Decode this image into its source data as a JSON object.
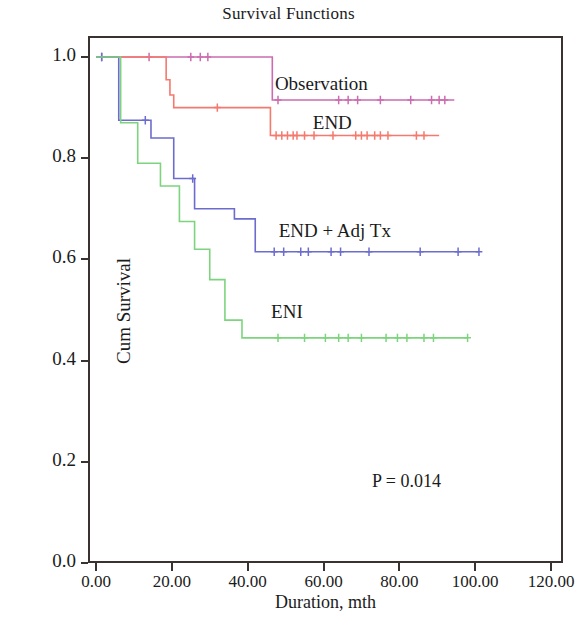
{
  "chart_data": {
    "type": "line",
    "title": "Survival Functions",
    "xlabel": "Duration, mth",
    "ylabel": "Cum Survival",
    "xlim": [
      0,
      120
    ],
    "ylim": [
      0.0,
      1.0
    ],
    "xticks": [
      "0.00",
      "20.00",
      "40.00",
      "60.00",
      "80.00",
      "100.00",
      "120.00"
    ],
    "xtick_values": [
      0,
      20,
      40,
      60,
      80,
      100,
      120
    ],
    "yticks": [
      "0.0",
      "0.2",
      "0.4",
      "0.6",
      "0.8",
      "1.0"
    ],
    "ytick_values": [
      0.0,
      0.2,
      0.4,
      0.6,
      0.8,
      1.0
    ],
    "grid": false,
    "legend_position": "inline-right-of-curves",
    "annotations": [
      {
        "text": "P = 0.014",
        "x": 84,
        "y": 0.17
      }
    ],
    "series": [
      {
        "name": "Observation",
        "color": "#cc6cb0",
        "label_x": 63,
        "label_y": 0.945,
        "steps": [
          [
            0,
            1.0
          ],
          [
            46.5,
            1.0
          ],
          [
            46.5,
            0.915
          ],
          [
            94.5,
            0.915
          ]
        ],
        "censored": [
          1.5,
          14.0,
          25.0,
          27.5,
          29.5,
          48.0,
          64.0,
          66.5,
          69.0,
          75.0,
          83.0,
          88.5,
          90.5,
          92.0
        ]
      },
      {
        "name": "END",
        "color": "#f4796e",
        "label_x": 73,
        "label_y": 0.868,
        "steps": [
          [
            0,
            1.0
          ],
          [
            18.5,
            1.0
          ],
          [
            18.5,
            0.955
          ],
          [
            19.5,
            0.955
          ],
          [
            19.5,
            0.925
          ],
          [
            20.5,
            0.925
          ],
          [
            20.5,
            0.9
          ],
          [
            46.0,
            0.9
          ],
          [
            46.0,
            0.845
          ],
          [
            90.5,
            0.845
          ]
        ],
        "censored": [
          47.5,
          49.0,
          50.5,
          52.0,
          53.0,
          55.0,
          57.5,
          62.5,
          68.5,
          70.0,
          71.5,
          73.5,
          75.0,
          77.0,
          84.5,
          86.5
        ],
        "censored_early": [
          32.0
        ]
      },
      {
        "name": "END + Adj Tx",
        "color": "#6c6cce",
        "label_x": 64,
        "label_y": 0.655,
        "steps": [
          [
            0,
            1.0
          ],
          [
            6.0,
            1.0
          ],
          [
            6.0,
            0.875
          ],
          [
            14.5,
            0.875
          ],
          [
            14.5,
            0.84
          ],
          [
            20.5,
            0.84
          ],
          [
            20.5,
            0.76
          ],
          [
            26.0,
            0.76
          ],
          [
            26.0,
            0.7
          ],
          [
            36.5,
            0.7
          ],
          [
            36.5,
            0.68
          ],
          [
            42.0,
            0.68
          ],
          [
            42.0,
            0.615
          ],
          [
            101.0,
            0.615
          ]
        ],
        "censored": [
          1.5,
          13.0,
          25.5,
          47.0,
          49.5,
          54.0,
          56.0,
          62.0,
          64.5,
          72.0,
          85.5,
          95.5,
          101.0
        ]
      },
      {
        "name": "ENI",
        "color": "#7ed47e",
        "label_x": 62,
        "label_y": 0.495,
        "steps": [
          [
            0,
            1.0
          ],
          [
            6.5,
            1.0
          ],
          [
            6.5,
            0.87
          ],
          [
            11.0,
            0.87
          ],
          [
            11.0,
            0.79
          ],
          [
            17.0,
            0.79
          ],
          [
            17.0,
            0.745
          ],
          [
            22.0,
            0.745
          ],
          [
            22.0,
            0.675
          ],
          [
            26.0,
            0.675
          ],
          [
            26.0,
            0.62
          ],
          [
            30.0,
            0.62
          ],
          [
            30.0,
            0.56
          ],
          [
            34.0,
            0.56
          ],
          [
            34.0,
            0.48
          ],
          [
            38.5,
            0.48
          ],
          [
            38.5,
            0.445
          ],
          [
            98.0,
            0.445
          ]
        ],
        "censored": [
          48.0,
          55.0,
          60.5,
          64.0,
          66.5,
          70.0,
          76.5,
          79.5,
          82.0,
          86.5,
          89.0,
          98.0
        ]
      }
    ]
  },
  "title": {
    "text": "Survival Functions"
  },
  "axes": {
    "x_title": "Duration, mth",
    "y_title": "Cum Survival"
  },
  "pvalue": {
    "text": "P = 0.014"
  }
}
